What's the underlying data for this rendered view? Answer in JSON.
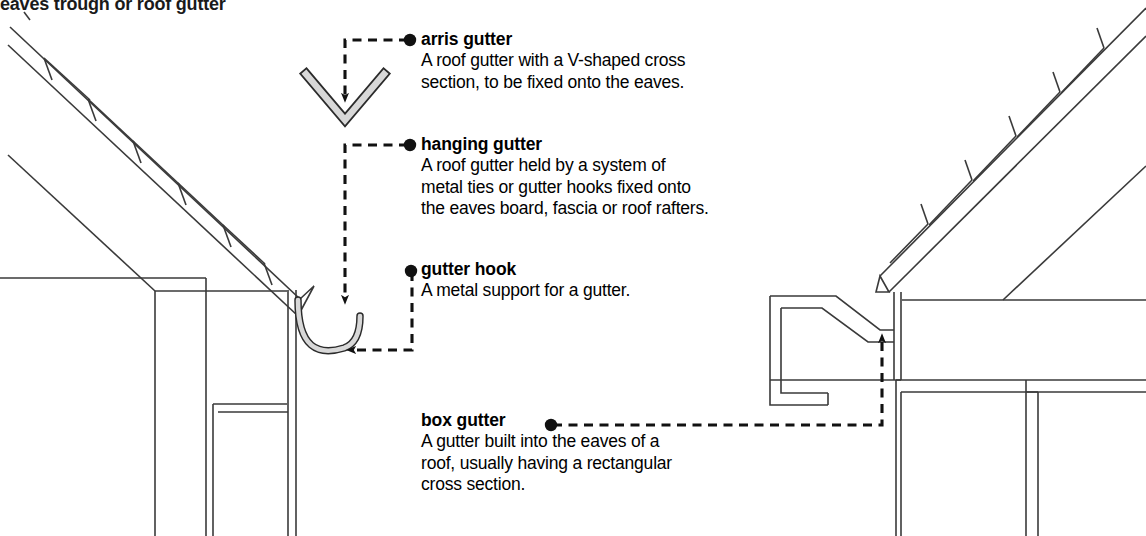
{
  "page": {
    "headline": "eaves trough or roof gutter",
    "background": "#ffffff",
    "ink": "#1a1a1a",
    "metal_fill": "#d8d8d8"
  },
  "entries": [
    {
      "id": "arris-gutter",
      "term": "arris gutter",
      "definition_lines": [
        "A roof gutter with a V-shaped cross",
        "section, to be fixed onto the eaves."
      ]
    },
    {
      "id": "hanging-gutter",
      "term": "hanging gutter",
      "definition_lines": [
        "A roof gutter held by a system of",
        "metal ties or gutter hooks fixed onto",
        "the eaves board, fascia or roof rafters."
      ]
    },
    {
      "id": "gutter-hook",
      "term": "gutter hook",
      "definition_lines": [
        "A metal support for a gutter."
      ]
    },
    {
      "id": "box-gutter",
      "term": "box gutter",
      "definition_lines": [
        "A gutter built into the eaves of a",
        "roof, usually having a rectangular",
        "cross section."
      ]
    }
  ]
}
